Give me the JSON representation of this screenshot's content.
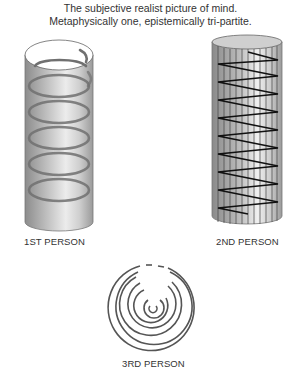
{
  "title": {
    "line1": "The subjective realist picture of mind.",
    "line2": "Metaphysically one, epistemically tri-partite."
  },
  "figures": [
    {
      "label": "1ST PERSON",
      "shape": "cylinder-with-helix"
    },
    {
      "label": "2ND PERSON",
      "shape": "striped-cylinder-with-zigzag"
    },
    {
      "label": "3RD PERSON",
      "shape": "flat-spiral"
    }
  ],
  "colors": {
    "cylinder_fill_dark": "#8f8f8f",
    "cylinder_fill_light": "#e8e8e8",
    "helix": "#6a6a6a",
    "zigzag": "#111111",
    "spiral": "#555555"
  }
}
